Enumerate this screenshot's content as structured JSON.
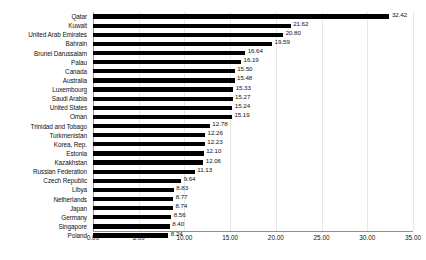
{
  "chart_data": {
    "type": "bar",
    "orientation": "horizontal",
    "title": "",
    "xlabel": "",
    "ylabel": "",
    "xlim": [
      0,
      35
    ],
    "xticks": [
      "0.00",
      "5.00",
      "10.00",
      "15.00",
      "20.00",
      "25.00",
      "30.00",
      "35.00"
    ],
    "xtick_values": [
      0,
      5,
      10,
      15,
      20,
      25,
      30,
      35
    ],
    "grid": true,
    "grid_axis": "x",
    "legend": "none",
    "bar_color": "#000000",
    "categories": [
      "Qatar",
      "Kuwait",
      "United Arab Emirates",
      "Bahrain",
      "Brunei Darussalam",
      "Palau",
      "Canada",
      "Australia",
      "Luxembourg",
      "Saudi Arabia",
      "United States",
      "Oman",
      "Trinidad and Tobago",
      "Turkmenistan",
      "Korea, Rep.",
      "Estonia",
      "Kazakhstan",
      "Russian Federation",
      "Czech Republic",
      "Libya",
      "Netherlands",
      "Japan",
      "Germany",
      "Singapore",
      "Poland"
    ],
    "values": [
      32.42,
      21.62,
      20.8,
      19.59,
      16.64,
      16.19,
      15.5,
      15.48,
      15.33,
      15.27,
      15.24,
      15.19,
      12.78,
      12.26,
      12.23,
      12.1,
      12.06,
      11.13,
      9.64,
      8.83,
      8.77,
      8.74,
      8.56,
      8.4,
      8.24
    ],
    "value_labels": [
      "32.42",
      "21.62",
      "20.80",
      "19.59",
      "16.64",
      "16.19",
      "15.50",
      "15.48",
      "15.33",
      "15.27",
      "15.24",
      "15.19",
      "12.78",
      "12.26",
      "12.23",
      "12.10",
      "12.06",
      "11.13",
      "9.64",
      "8.83",
      "8.77",
      "8.74",
      "8.56",
      "8.40",
      "8.24"
    ]
  },
  "caption": {
    "text": ""
  }
}
